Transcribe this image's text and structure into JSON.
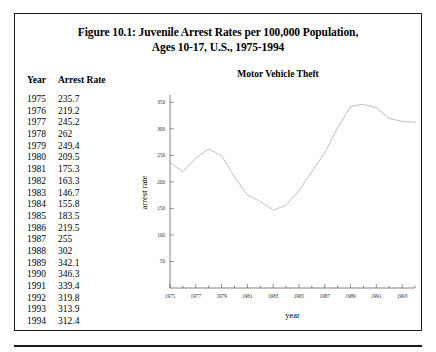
{
  "figure": {
    "title_line1": "Figure 10.1: Juvenile Arrest Rates per 100,000 Population,",
    "title_line2": "Ages 10-17, U.S., 1975-1994"
  },
  "table": {
    "headers": [
      "Year",
      "Arrest Rate"
    ],
    "rows": [
      [
        "1975",
        "235.7"
      ],
      [
        "1976",
        "219.2"
      ],
      [
        "1977",
        "245.2"
      ],
      [
        "1978",
        "262"
      ],
      [
        "1979",
        "249.4"
      ],
      [
        "1980",
        "209.5"
      ],
      [
        "1981",
        "175.3"
      ],
      [
        "1982",
        "163.3"
      ],
      [
        "1983",
        "146.7"
      ],
      [
        "1984",
        "155.8"
      ],
      [
        "1985",
        "183.5"
      ],
      [
        "1986",
        "219.5"
      ],
      [
        "1987",
        "255"
      ],
      [
        "1988",
        "302"
      ],
      [
        "1989",
        "342.1"
      ],
      [
        "1990",
        "346.3"
      ],
      [
        "1991",
        "339.4"
      ],
      [
        "1992",
        "319.8"
      ],
      [
        "1993",
        "313.9"
      ],
      [
        "1994",
        "312.4"
      ]
    ]
  },
  "chart_data": {
    "type": "line",
    "title": "Motor Vehicle Theft",
    "xlabel": "year",
    "ylabel": "arrest rate",
    "x": [
      1975,
      1976,
      1977,
      1978,
      1979,
      1980,
      1981,
      1982,
      1983,
      1984,
      1985,
      1986,
      1987,
      1988,
      1989,
      1990,
      1991,
      1992,
      1993,
      1994
    ],
    "values": [
      235.7,
      219.2,
      245.2,
      262,
      249.4,
      209.5,
      175.3,
      163.3,
      146.7,
      155.8,
      183.5,
      219.5,
      255,
      302,
      342.1,
      346.3,
      339.4,
      319.8,
      313.9,
      312.4
    ],
    "series": [
      {
        "name": "Motor Vehicle Theft",
        "values": [
          235.7,
          219.2,
          245.2,
          262,
          249.4,
          209.5,
          175.3,
          163.3,
          146.7,
          155.8,
          183.5,
          219.5,
          255,
          302,
          342.1,
          346.3,
          339.4,
          319.8,
          313.9,
          312.4
        ]
      }
    ],
    "xlim": [
      1975,
      1994
    ],
    "ylim": [
      0,
      360
    ],
    "yticks": [
      50,
      100,
      150,
      200,
      250,
      300,
      350
    ],
    "ytick_labels": [
      "50",
      "100",
      "150",
      "200",
      "250",
      "300",
      "350"
    ],
    "xticks": [
      1975,
      1977,
      1979,
      1981,
      1983,
      1985,
      1987,
      1989,
      1991,
      1993
    ],
    "xtick_labels": [
      "1975",
      "1977",
      "1979",
      "1981",
      "1983",
      "1985",
      "1987",
      "1989",
      "1991",
      "1993"
    ],
    "xminor_ticks": [
      1976,
      1978,
      1980,
      1982,
      1984,
      1986,
      1988,
      1990,
      1992,
      1994
    ],
    "grid": false,
    "legend": "none",
    "line_color": "#b9b9b9"
  }
}
